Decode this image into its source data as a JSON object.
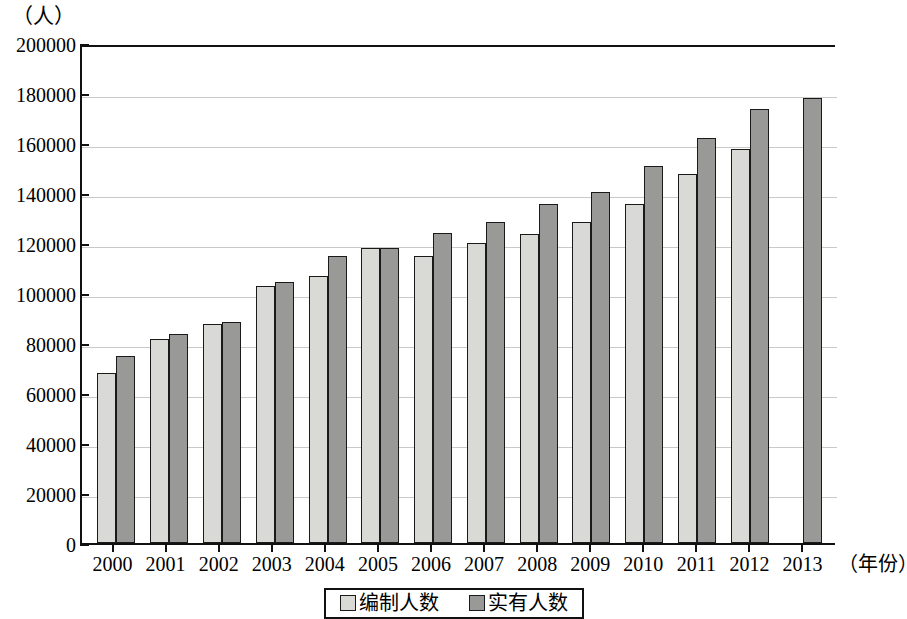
{
  "axes": {
    "y_unit_label": "（人）",
    "x_unit_label": "（年份）",
    "y_ticks": [
      "200000",
      "180000",
      "160000",
      "140000",
      "120000",
      "100000",
      "80000",
      "60000",
      "40000",
      "20000",
      "0"
    ]
  },
  "legend": {
    "items": [
      {
        "label": "编制人数",
        "color": "#d9d9d6",
        "swatch": "light"
      },
      {
        "label": "实有人数",
        "color": "#999997",
        "swatch": "dark"
      }
    ]
  },
  "colors": {
    "series_light": "#d9d9d6",
    "series_dark": "#999997",
    "bar_outline": "#1a1a1a",
    "gridline": "#c9c9c9",
    "axis": "#111111"
  },
  "chart_data": {
    "type": "bar",
    "title": "",
    "subtitle": "",
    "xlabel": "（年份）",
    "ylabel": "（人）",
    "ylim": [
      0,
      200000
    ],
    "ytick_step": 20000,
    "grid": true,
    "legend_position": "bottom-center",
    "categories": [
      "2000",
      "2001",
      "2002",
      "2003",
      "2004",
      "2005",
      "2006",
      "2007",
      "2008",
      "2009",
      "2010",
      "2011",
      "2012",
      "2013"
    ],
    "series": [
      {
        "name": "编制人数",
        "color": "#d9d9d6",
        "values": [
          68000,
          81500,
          87500,
          103000,
          107000,
          118000,
          115000,
          120000,
          123500,
          128500,
          135500,
          147500,
          157500,
          null
        ]
      },
      {
        "name": "实有人数",
        "color": "#999997",
        "values": [
          75000,
          83500,
          88500,
          104500,
          115000,
          118000,
          124000,
          128500,
          135500,
          140500,
          151000,
          162000,
          173500,
          178000
        ]
      }
    ]
  }
}
